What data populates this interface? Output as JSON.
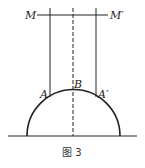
{
  "figure": {
    "caption": "图 3",
    "labels": {
      "M": "M",
      "M_prime": "M′",
      "A": "A",
      "B": "B",
      "A_prime": "A′"
    }
  },
  "colors": {
    "line": "#222222",
    "background": "#ffffff"
  }
}
